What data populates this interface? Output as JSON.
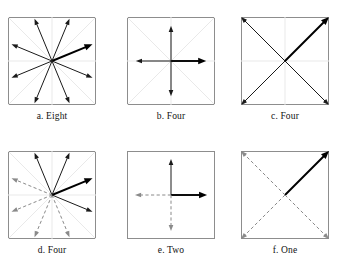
{
  "figure": {
    "rows": 2,
    "columns": 3,
    "square_size_px": 88,
    "colors": {
      "border": "#8d8d8d",
      "guide_line": "#e9e9e9",
      "solid_arrow": "#1a1a1a",
      "bold_arrow": "#000000",
      "dashed_arrow": "#8a8a8a",
      "background": "#ffffff",
      "caption_text": "#111111"
    },
    "panels": [
      {
        "id": "a",
        "caption": "a. Eight",
        "letter": "a",
        "word": "Eight",
        "count": 8,
        "guides": [
          "horizontal",
          "vertical",
          "diagonal-up",
          "diagonal-down"
        ],
        "arrows": [
          {
            "angle_deg": 22.5,
            "style": "bold",
            "length": 0.92
          },
          {
            "angle_deg": 67.5,
            "style": "solid",
            "length": 0.96
          },
          {
            "angle_deg": 112.5,
            "style": "solid",
            "length": 0.96
          },
          {
            "angle_deg": 157.5,
            "style": "solid",
            "length": 0.92
          },
          {
            "angle_deg": 202.5,
            "style": "solid",
            "length": 0.92
          },
          {
            "angle_deg": 247.5,
            "style": "solid",
            "length": 0.96
          },
          {
            "angle_deg": 292.5,
            "style": "solid",
            "length": 0.96
          },
          {
            "angle_deg": 337.5,
            "style": "solid",
            "length": 0.92
          }
        ]
      },
      {
        "id": "b",
        "caption": "b. Four",
        "letter": "b",
        "word": "Four",
        "count": 4,
        "guides": [
          "horizontal",
          "vertical",
          "diagonal-up",
          "diagonal-down"
        ],
        "arrows": [
          {
            "angle_deg": 0,
            "style": "bold",
            "length": 0.8
          },
          {
            "angle_deg": 90,
            "style": "solid",
            "length": 0.8
          },
          {
            "angle_deg": 180,
            "style": "solid",
            "length": 0.8
          },
          {
            "angle_deg": 270,
            "style": "solid",
            "length": 0.8
          }
        ]
      },
      {
        "id": "c",
        "caption": "c. Four",
        "letter": "c",
        "word": "Four",
        "count": 4,
        "guides": [
          "horizontal",
          "vertical",
          "diagonal-up",
          "diagonal-down"
        ],
        "arrows": [
          {
            "angle_deg": 45,
            "style": "bold",
            "length": 1.0
          },
          {
            "angle_deg": 135,
            "style": "solid",
            "length": 1.0
          },
          {
            "angle_deg": 225,
            "style": "solid",
            "length": 1.0
          },
          {
            "angle_deg": 315,
            "style": "solid",
            "length": 1.0
          }
        ]
      },
      {
        "id": "d",
        "caption": "d. Four",
        "letter": "d",
        "word": "Four",
        "count": 4,
        "guides": [
          "horizontal",
          "vertical",
          "diagonal-up",
          "diagonal-down"
        ],
        "arrows": [
          {
            "angle_deg": 22.5,
            "style": "bold",
            "length": 0.92
          },
          {
            "angle_deg": 67.5,
            "style": "solid",
            "length": 0.96
          },
          {
            "angle_deg": 112.5,
            "style": "solid",
            "length": 0.96
          },
          {
            "angle_deg": 157.5,
            "style": "dashed",
            "length": 0.92
          },
          {
            "angle_deg": 202.5,
            "style": "dashed",
            "length": 0.92
          },
          {
            "angle_deg": 247.5,
            "style": "dashed",
            "length": 0.96
          },
          {
            "angle_deg": 292.5,
            "style": "dashed",
            "length": 0.96
          },
          {
            "angle_deg": 337.5,
            "style": "solid",
            "length": 0.92
          }
        ]
      },
      {
        "id": "e",
        "caption": "e. Two",
        "letter": "e",
        "word": "Two",
        "count": 2,
        "guides": [],
        "arrows": [
          {
            "angle_deg": 0,
            "style": "bold",
            "length": 0.82
          },
          {
            "angle_deg": 90,
            "style": "solid",
            "length": 0.82
          },
          {
            "angle_deg": 180,
            "style": "dashed",
            "length": 0.82
          },
          {
            "angle_deg": 270,
            "style": "dashed",
            "length": 0.82
          }
        ]
      },
      {
        "id": "f",
        "caption": "f. One",
        "letter": "f",
        "word": "One",
        "count": 1,
        "guides": [],
        "arrows": [
          {
            "angle_deg": 45,
            "style": "bold",
            "length": 1.0
          },
          {
            "angle_deg": 135,
            "style": "dashed",
            "length": 1.0
          },
          {
            "angle_deg": 225,
            "style": "dashed",
            "length": 1.0
          },
          {
            "angle_deg": 315,
            "style": "dashed",
            "length": 1.0
          }
        ]
      }
    ]
  }
}
